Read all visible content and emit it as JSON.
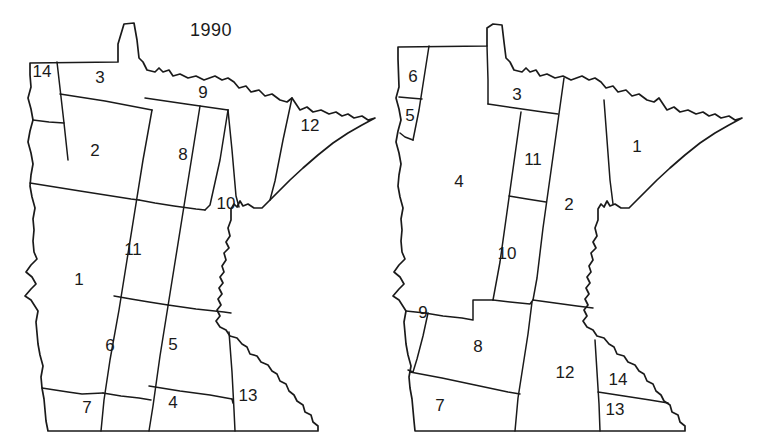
{
  "figure": {
    "kind": "paired-choropleth-outline-maps",
    "stroke_color": "#1a1a1a",
    "background_color": "#ffffff"
  },
  "panels": [
    {
      "id": "panel-1990",
      "title": "1990",
      "region_count": 14,
      "regions": [
        {
          "label": "14",
          "x": 42,
          "y": 73
        },
        {
          "label": "3",
          "x": 100,
          "y": 79
        },
        {
          "label": "9",
          "x": 203,
          "y": 94
        },
        {
          "label": "12",
          "x": 310,
          "y": 127
        },
        {
          "label": "2",
          "x": 95,
          "y": 152
        },
        {
          "label": "8",
          "x": 183,
          "y": 156
        },
        {
          "label": "10",
          "x": 226,
          "y": 205
        },
        {
          "label": "11",
          "x": 133,
          "y": 251
        },
        {
          "label": "1",
          "x": 79,
          "y": 281
        },
        {
          "label": "6",
          "x": 110,
          "y": 347
        },
        {
          "label": "5",
          "x": 173,
          "y": 346
        },
        {
          "label": "7",
          "x": 87,
          "y": 409
        },
        {
          "label": "4",
          "x": 173,
          "y": 404
        },
        {
          "label": "13",
          "x": 248,
          "y": 397
        }
      ]
    },
    {
      "id": "panel-2000",
      "title": "2000",
      "region_count": 14,
      "regions": [
        {
          "label": "6",
          "x": 33,
          "y": 78
        },
        {
          "label": "5",
          "x": 30,
          "y": 117
        },
        {
          "label": "3",
          "x": 137,
          "y": 96
        },
        {
          "label": "1",
          "x": 257,
          "y": 148
        },
        {
          "label": "11",
          "x": 153,
          "y": 161
        },
        {
          "label": "4",
          "x": 79,
          "y": 183
        },
        {
          "label": "2",
          "x": 189,
          "y": 206
        },
        {
          "label": "10",
          "x": 127,
          "y": 255
        },
        {
          "label": "9",
          "x": 43,
          "y": 314
        },
        {
          "label": "8",
          "x": 98,
          "y": 348
        },
        {
          "label": "12",
          "x": 185,
          "y": 374
        },
        {
          "label": "14",
          "x": 238,
          "y": 381
        },
        {
          "label": "7",
          "x": 60,
          "y": 407
        },
        {
          "label": "13",
          "x": 235,
          "y": 411
        }
      ]
    }
  ]
}
